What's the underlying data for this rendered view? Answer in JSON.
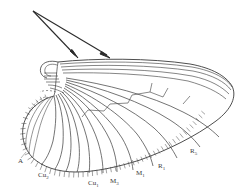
{
  "figure": {
    "background_color": "#ffffff",
    "ink_color": "#2f2f2f",
    "line_color": "#4a4a4a",
    "fringe_color": "#5a5a5a",
    "width": 250,
    "height": 192
  },
  "annotations": {
    "arrows": [
      {
        "name": "arrow-costal-upper",
        "origin_x": 33,
        "origin_y": 11,
        "tip_x": 78,
        "tip_y": 58
      },
      {
        "name": "arrow-costal-lower",
        "origin_x": 33,
        "origin_y": 11,
        "tip_x": 110,
        "tip_y": 58
      }
    ]
  },
  "labels": [
    {
      "id": "A",
      "text": "A",
      "sub": "",
      "x": 18,
      "y": 160
    },
    {
      "id": "Cu2",
      "text": "Cu",
      "sub": "2",
      "x": 38,
      "y": 174
    },
    {
      "id": "Cu1",
      "text": "Cu",
      "sub": "1",
      "x": 88,
      "y": 182
    },
    {
      "id": "M3",
      "text": "M",
      "sub": "3",
      "x": 110,
      "y": 180
    },
    {
      "id": "M1",
      "text": "M",
      "sub": "1",
      "x": 136,
      "y": 172
    },
    {
      "id": "R1",
      "text": "R",
      "sub": "1",
      "x": 158,
      "y": 165
    },
    {
      "id": "R5",
      "text": "R",
      "sub": "5",
      "x": 190,
      "y": 150
    }
  ],
  "structure": {
    "wing_base": "articulated hinge at left with short parallel sclerite lines",
    "costal_margin": "bundle of tightly spaced longitudinal veins along the leading edge",
    "anal_lobe": "broad rounded lobe at lower left",
    "fringe": "dense fine setae along the posterior and anal margin",
    "apex": "rounded wing tip at right with converging radial veins",
    "cross_veins": "short zigzag cross-veins linking radial and medial veins in mid-wing"
  }
}
